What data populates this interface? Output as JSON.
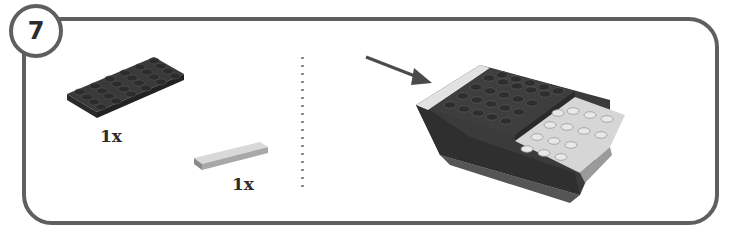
{
  "step": {
    "number": "7",
    "parts": [
      {
        "name": "plate-4x6",
        "color": "dark-gray",
        "quantity": "1x"
      },
      {
        "name": "tile-1x4",
        "color": "light-gray",
        "quantity": "1x"
      }
    ],
    "assembly": {
      "arrow": "arrow-icon",
      "model": "assembled-model"
    }
  },
  "colors": {
    "frame": "#5f5f5f",
    "dark_brick": "#3c3c3c",
    "light_brick": "#d8d8d8",
    "text": "#2b2b2b"
  }
}
